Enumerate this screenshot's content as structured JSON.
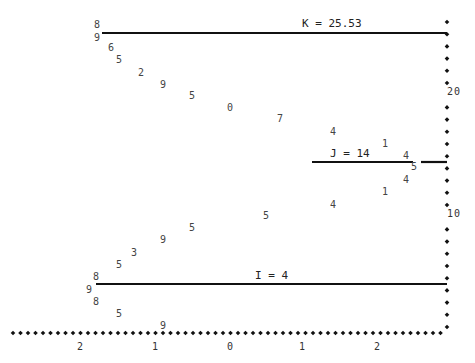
{
  "chart_data": {
    "type": "scatter",
    "title": "",
    "xlabel": "",
    "ylabel": "",
    "grid": false,
    "legend": "none",
    "x_ticks": [
      {
        "label": "2",
        "px": 80
      },
      {
        "label": "1",
        "px": 155
      },
      {
        "label": "0",
        "px": 230
      },
      {
        "label": "1",
        "px": 302
      },
      {
        "label": "2",
        "px": 377
      }
    ],
    "y_ticks": [
      {
        "label": "20",
        "py": 91
      },
      {
        "label": "10",
        "py": 213
      }
    ],
    "reference_lines": [
      {
        "name": "K",
        "label": "K = 25.53",
        "value": 25.53,
        "y": 33,
        "x1": 102,
        "x2": 447,
        "label_x": 302,
        "label_y": 27
      },
      {
        "name": "J",
        "label": "J = 14",
        "value": 14,
        "y": 162,
        "segments": [
          [
            312,
            413
          ],
          [
            421,
            447
          ]
        ],
        "label_x": 330,
        "label_y": 157
      },
      {
        "name": "I",
        "label": "I = 4",
        "value": 4,
        "y": 284,
        "x1": 96,
        "x2": 447,
        "label_x": 255,
        "label_y": 279
      }
    ],
    "points": [
      {
        "d": "8",
        "x": 97,
        "y": 24
      },
      {
        "d": "9",
        "x": 97,
        "y": 37
      },
      {
        "d": "6",
        "x": 111,
        "y": 47
      },
      {
        "d": "5",
        "x": 119,
        "y": 59
      },
      {
        "d": "2",
        "x": 141,
        "y": 72
      },
      {
        "d": "9",
        "x": 163,
        "y": 84
      },
      {
        "d": "5",
        "x": 192,
        "y": 95
      },
      {
        "d": "0",
        "x": 230,
        "y": 107
      },
      {
        "d": "7",
        "x": 280,
        "y": 118
      },
      {
        "d": "4",
        "x": 333,
        "y": 131
      },
      {
        "d": "1",
        "x": 385,
        "y": 143
      },
      {
        "d": "4",
        "x": 406,
        "y": 155
      },
      {
        "d": "5",
        "x": 414,
        "y": 166
      },
      {
        "d": "4",
        "x": 406,
        "y": 179
      },
      {
        "d": "1",
        "x": 385,
        "y": 191
      },
      {
        "d": "4",
        "x": 333,
        "y": 204
      },
      {
        "d": "5",
        "x": 266,
        "y": 215
      },
      {
        "d": "5",
        "x": 192,
        "y": 227
      },
      {
        "d": "9",
        "x": 163,
        "y": 239
      },
      {
        "d": "3",
        "x": 134,
        "y": 252
      },
      {
        "d": "5",
        "x": 119,
        "y": 264
      },
      {
        "d": "8",
        "x": 96,
        "y": 276
      },
      {
        "d": "9",
        "x": 89,
        "y": 289
      },
      {
        "d": "8",
        "x": 96,
        "y": 301
      },
      {
        "d": "5",
        "x": 119,
        "y": 313
      },
      {
        "d": "9",
        "x": 163,
        "y": 325
      }
    ],
    "axes": {
      "bottom": {
        "y": 333,
        "x_start": 13,
        "x_end": 447,
        "spacing": 7.5
      },
      "right": {
        "x": 447,
        "y_start": 22,
        "y_end": 333,
        "spacing": 12.2
      }
    }
  }
}
